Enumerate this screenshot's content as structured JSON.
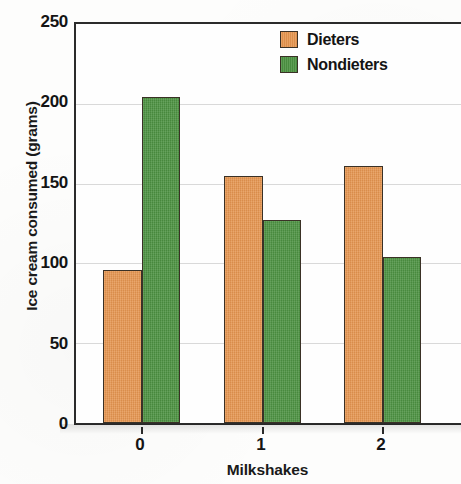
{
  "chart_data": {
    "type": "bar",
    "title": "",
    "xlabel": "Milkshakes",
    "ylabel": "Ice cream consumed (grams)",
    "categories": [
      "0",
      "1",
      "2"
    ],
    "series": [
      {
        "name": "Dieters",
        "color": "#e5954f",
        "values": [
          96,
          155,
          161
        ]
      },
      {
        "name": "Nondieters",
        "color": "#4d9342",
        "values": [
          204,
          127,
          104
        ]
      }
    ],
    "ylim": [
      0,
      250
    ],
    "yticks": [
      0,
      50,
      100,
      150,
      200,
      250
    ],
    "ytick_labels": [
      "0",
      "50",
      "100",
      "150",
      "200",
      "250"
    ],
    "xtick_labels": [
      "0",
      "1",
      "2"
    ],
    "grid": "horizontal",
    "legend_position": "top-right",
    "bar_border_color": "#3a3126",
    "axis_color": "#2b2b2b",
    "gridline_color": "#d9d9d9"
  },
  "legend": {
    "entries": [
      {
        "label": "Dieters",
        "swatch": "orange-swatch"
      },
      {
        "label": "Nondieters",
        "swatch": "green-swatch"
      }
    ]
  },
  "axes": {
    "y_title": "Ice cream consumed (grams)",
    "x_title": "Milkshakes"
  }
}
